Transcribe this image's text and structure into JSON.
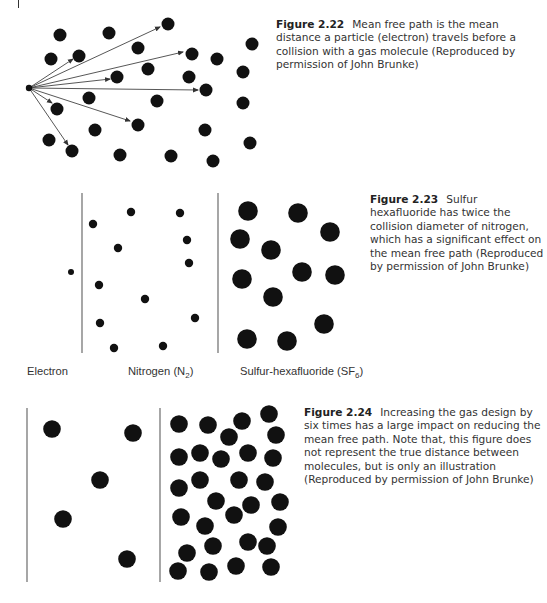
{
  "figures": [
    {
      "number": "Figure 2.22",
      "caption": "Mean free path is the mean distance a particle (electron) travels before a collision with a gas molecule (Reproduced by permission of John Brunke)",
      "diagram": {
        "electron_origin": [
          29,
          88
        ],
        "molecule_radius": 6.5,
        "molecules": [
          [
            60,
            35
          ],
          [
            109,
            33
          ],
          [
            168,
            24
          ],
          [
            51,
            59
          ],
          [
            79,
            56
          ],
          [
            138,
            48
          ],
          [
            192,
            54
          ],
          [
            217,
            59
          ],
          [
            252,
            44
          ],
          [
            148,
            69
          ],
          [
            117,
            77
          ],
          [
            189,
            77
          ],
          [
            243,
            72
          ],
          [
            206,
            90
          ],
          [
            89,
            98
          ],
          [
            157,
            101
          ],
          [
            243,
            103
          ],
          [
            57,
            109
          ],
          [
            138,
            125
          ],
          [
            95,
            130
          ],
          [
            205,
            130
          ],
          [
            49,
            140
          ],
          [
            72,
            151
          ],
          [
            120,
            155
          ],
          [
            171,
            156
          ],
          [
            213,
            161
          ],
          [
            250,
            143
          ]
        ],
        "arrow_ends": [
          [
            160,
            27
          ],
          [
            183,
            52
          ],
          [
            73,
            59
          ],
          [
            110,
            79
          ],
          [
            198,
            90
          ],
          [
            52,
            103
          ],
          [
            130,
            121
          ],
          [
            68,
            145
          ]
        ]
      }
    },
    {
      "number": "Figure 2.23",
      "caption": "Sulfur hexafluoride has twice the collision diameter of nitrogen, which has a significant effect on the mean free path (Reproduced by permission of John Brunke)",
      "panels": [
        {
          "label": "Electron",
          "sub": "",
          "suffix": ""
        },
        {
          "label": "Nitrogen (N",
          "sub": "2",
          "suffix": ")"
        },
        {
          "label": "Sulfur-hexafluoride (SF",
          "sub": "6",
          "suffix": ")"
        }
      ],
      "diagram": {
        "dividers_x": [
          82,
          218
        ],
        "divider_y": [
          193,
          353
        ],
        "electron": {
          "pos": [
            71,
            272
          ],
          "radius": 3
        },
        "nitrogen": {
          "radius": 4.2,
          "molecules": [
            [
              93,
              224
            ],
            [
              131,
              212
            ],
            [
              180,
              213
            ],
            [
              187,
              240
            ],
            [
              118,
              248
            ],
            [
              189,
              263
            ],
            [
              99,
              285
            ],
            [
              145,
              299
            ],
            [
              195,
              318
            ],
            [
              100,
              323
            ],
            [
              114,
              348
            ],
            [
              163,
              346
            ]
          ]
        },
        "sf6": {
          "radius": 9.8,
          "molecules": [
            [
              248,
              211
            ],
            [
              298,
              213
            ],
            [
              330,
              232
            ],
            [
              240,
              239
            ],
            [
              271,
              250
            ],
            [
              242,
              279
            ],
            [
              302,
              272
            ],
            [
              335,
              275
            ],
            [
              273,
              297
            ],
            [
              324,
              324
            ],
            [
              247,
              339
            ],
            [
              287,
              341
            ]
          ]
        }
      }
    },
    {
      "number": "Figure 2.24",
      "caption": "Increasing the gas design by six times has a large impact on reducing the mean free path. Note that, this figure does not represent the true distance between molecules, but is only an illustration (Reproduced by permission of John Brunke)",
      "diagram": {
        "dividers_x": [
          27,
          160
        ],
        "divider_y": [
          408,
          582
        ],
        "radius": 8.8,
        "left_molecules": [
          [
            52,
            429
          ],
          [
            133,
            433
          ],
          [
            100,
            480
          ],
          [
            63,
            519
          ],
          [
            127,
            559
          ]
        ],
        "right_molecules": [
          [
            179,
            424
          ],
          [
            208,
            425
          ],
          [
            242,
            421
          ],
          [
            269,
            414
          ],
          [
            229,
            437
          ],
          [
            276,
            435
          ],
          [
            179,
            457
          ],
          [
            200,
            453
          ],
          [
            221,
            459
          ],
          [
            248,
            453
          ],
          [
            273,
            458
          ],
          [
            179,
            488
          ],
          [
            200,
            480
          ],
          [
            239,
            480
          ],
          [
            265,
            482
          ],
          [
            216,
            501
          ],
          [
            251,
            505
          ],
          [
            280,
            502
          ],
          [
            181,
            517
          ],
          [
            205,
            526
          ],
          [
            234,
            515
          ],
          [
            278,
            527
          ],
          [
            187,
            553
          ],
          [
            213,
            546
          ],
          [
            248,
            542
          ],
          [
            267,
            546
          ],
          [
            178,
            571
          ],
          [
            209,
            572
          ],
          [
            236,
            566
          ],
          [
            271,
            567
          ]
        ]
      }
    }
  ]
}
